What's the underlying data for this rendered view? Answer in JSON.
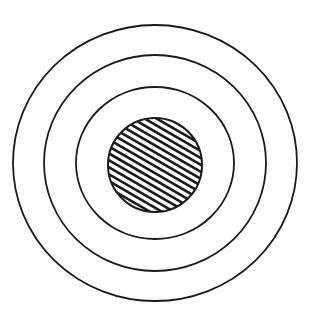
{
  "figure": {
    "background": "#ffffff",
    "stroke_color": "#1a1a1a",
    "center": {
      "cx": 155,
      "cy": 163
    },
    "rings": [
      {
        "name": "outer-ring",
        "rx": 142,
        "ry": 138
      },
      {
        "name": "middle-ring",
        "rx": 111,
        "ry": 108
      },
      {
        "name": "inner-ring",
        "rx": 79,
        "ry": 76
      }
    ],
    "core": {
      "name": "hatched-core",
      "cx": 155,
      "cy": 165,
      "r": 47,
      "hatch_spacing": 6,
      "hatch_angle": 30
    }
  }
}
